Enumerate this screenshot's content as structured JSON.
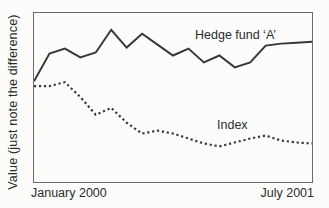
{
  "figure": {
    "ylabel": "Value (just note the difference)",
    "x_axis_start": "January 2000",
    "x_axis_end": "July 2001"
  },
  "colors": {
    "line": "#383838",
    "frame": "#6b6b6b",
    "text": "#2b2b2b",
    "background": "#fcfcfb"
  },
  "chart_data": {
    "type": "line",
    "title": "",
    "xlabel": "",
    "ylabel": "Value (just note the difference)",
    "x_tick_labels": [
      "January 2000",
      "July 2001"
    ],
    "x": [
      "Jan 2000",
      "Feb 2000",
      "Mar 2000",
      "Apr 2000",
      "May 2000",
      "Jun 2000",
      "Jul 2000",
      "Aug 2000",
      "Sep 2000",
      "Oct 2000",
      "Nov 2000",
      "Dec 2000",
      "Jan 2001",
      "Feb 2001",
      "Mar 2001",
      "Apr 2001",
      "May 2001",
      "Jun 2001",
      "Jul 2001"
    ],
    "ylim": [
      0,
      171
    ],
    "y_scale_note": "relative units; axis shows no numeric scale",
    "grid": false,
    "legend_position": "inline annotations next to each line",
    "series": [
      {
        "name": "Hedge fund ‘A’",
        "line_style": "solid",
        "values": [
          102,
          130,
          135,
          126,
          131,
          154,
          136,
          150,
          139,
          128,
          135,
          121,
          128,
          116,
          121,
          138,
          140,
          141,
          142
        ]
      },
      {
        "name": "Index",
        "line_style": "dotted",
        "values": [
          97,
          97,
          101,
          86,
          68,
          75,
          60,
          49,
          52,
          49,
          44,
          39,
          36,
          40,
          44,
          47,
          42,
          40,
          39
        ]
      }
    ]
  }
}
